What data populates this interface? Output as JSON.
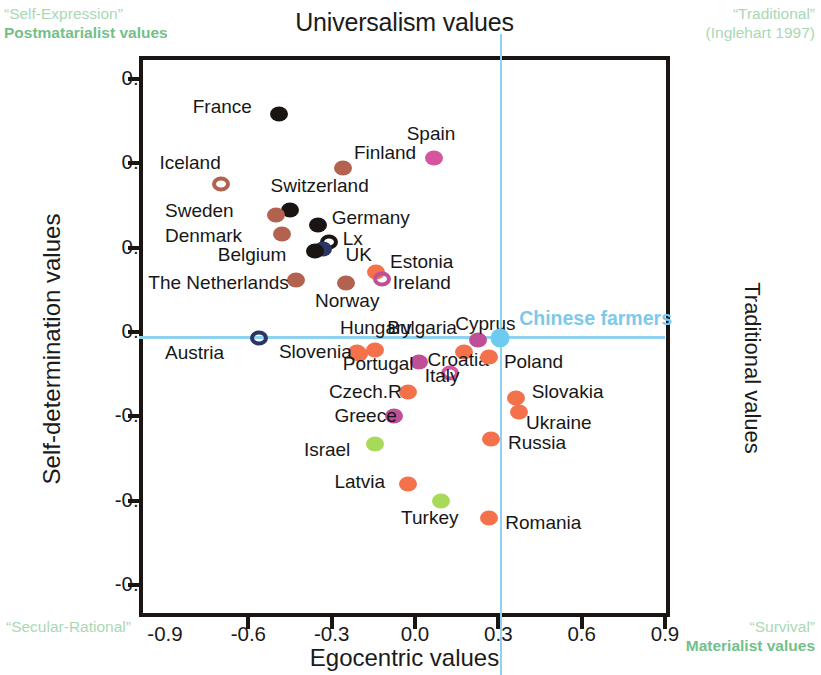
{
  "corners": {
    "top_left_quote": "“Self-Expression”",
    "top_left_bold": "Postmatarialist values",
    "top_right_quote": "“Traditional”",
    "top_right_source": "(Inglehart 1997)",
    "bottom_left_quote": "“Secular-Rational”",
    "bottom_right_quote": "“Survival”",
    "bottom_right_bold": "Materialist values"
  },
  "axes": {
    "title": "Universalism values",
    "xlabel": "Egocentric values",
    "ylabel": "Self-determination values",
    "right_label": "Traditional values",
    "xticks": [
      "-0.9",
      "-0.6",
      "-0.3",
      "0.0",
      "0.3",
      "0.6",
      "0.9"
    ],
    "yticks": [
      "0.9",
      "0.6",
      "0.3",
      "0.0",
      "-0.3",
      "-0.6",
      "-0.9"
    ]
  },
  "colors": {
    "orange": "#f4714b",
    "magenta": "#bf4f97",
    "pink": "#d6559f",
    "brown": "#b3624f",
    "black": "#1a1512",
    "navy": "#2b3566",
    "green": "#a8da5a",
    "lightblue": "#6ecbf0",
    "annotation_green": "#7cc58f",
    "reference_line": "#8ed2ef"
  },
  "chart_data": {
    "type": "scatter",
    "title": "Universalism values",
    "xlabel": "Egocentric values",
    "ylabel": "Self-determination values",
    "xlim": [
      -1.05,
      1.05
    ],
    "ylim": [
      -1.05,
      1.05
    ],
    "grid": false,
    "legend": "none",
    "reference_lines": {
      "x": 0.305,
      "y": -0.015,
      "label": "Chinese farmers"
    },
    "points": [
      {
        "name": "France",
        "x": -0.49,
        "y": 0.775,
        "color": "black",
        "filled": true,
        "lx": -0.8,
        "ly": 0.8
      },
      {
        "name": "Spain",
        "x": 0.07,
        "y": 0.62,
        "color": "pink",
        "filled": true,
        "lx": -0.03,
        "ly": 0.705
      },
      {
        "name": "Finland",
        "x": -0.26,
        "y": 0.585,
        "color": "brown",
        "filled": true,
        "lx": -0.22,
        "ly": 0.635
      },
      {
        "name": "Iceland",
        "x": -0.7,
        "y": 0.525,
        "color": "brown",
        "filled": false,
        "lx": -0.92,
        "ly": 0.6
      },
      {
        "name": "Switzerland",
        "x": -0.45,
        "y": 0.435,
        "color": "black",
        "filled": true,
        "lx": -0.52,
        "ly": 0.52
      },
      {
        "name": "Sweden",
        "x": -0.5,
        "y": 0.415,
        "color": "brown",
        "filled": true,
        "lx": -0.9,
        "ly": 0.43
      },
      {
        "name": "Germany",
        "x": -0.35,
        "y": 0.38,
        "color": "black",
        "filled": true,
        "lx": -0.3,
        "ly": 0.405
      },
      {
        "name": "Denmark",
        "x": -0.48,
        "y": 0.35,
        "color": "brown",
        "filled": true,
        "lx": -0.9,
        "ly": 0.34
      },
      {
        "name": "Lx",
        "x": -0.31,
        "y": 0.32,
        "color": "black",
        "filled": false,
        "lx": -0.26,
        "ly": 0.33
      },
      {
        "name": "UK",
        "x": -0.33,
        "y": 0.295,
        "color": "navy",
        "filled": true,
        "lx": -0.25,
        "ly": 0.275
      },
      {
        "name": "Belgium",
        "x": -0.36,
        "y": 0.288,
        "color": "black",
        "filled": true,
        "lx": -0.71,
        "ly": 0.275
      },
      {
        "name": "Estonia",
        "x": -0.14,
        "y": 0.215,
        "color": "orange",
        "filled": true,
        "lx": -0.09,
        "ly": 0.25
      },
      {
        "name": "Ireland",
        "x": -0.12,
        "y": 0.19,
        "color": "magenta",
        "filled": false,
        "lx": -0.08,
        "ly": 0.175
      },
      {
        "name": "The Netherlands",
        "x": -0.43,
        "y": 0.185,
        "color": "brown",
        "filled": true,
        "lx": -0.96,
        "ly": 0.175
      },
      {
        "name": "Norway",
        "x": -0.25,
        "y": 0.175,
        "color": "brown",
        "filled": true,
        "lx": -0.36,
        "ly": 0.11
      },
      {
        "name": "Austria",
        "x": -0.56,
        "y": -0.02,
        "color": "navy",
        "filled": false,
        "lx": -0.9,
        "ly": -0.075
      },
      {
        "name": "Cyprus",
        "x": 0.225,
        "y": -0.03,
        "color": "magenta",
        "filled": true,
        "lx": 0.145,
        "ly": 0.03
      },
      {
        "name": "Chinese farmers",
        "x": 0.305,
        "y": -0.02,
        "color": "lightblue",
        "filled": true,
        "lx": 0.375,
        "ly": 0.045
      },
      {
        "name": "Hungary",
        "x": -0.21,
        "y": -0.07,
        "color": "orange",
        "filled": true,
        "lx": -0.27,
        "ly": 0.015
      },
      {
        "name": "Bulgaria",
        "x": -0.145,
        "y": -0.065,
        "color": "orange",
        "filled": true,
        "lx": -0.1,
        "ly": 0.015
      },
      {
        "name": "Slovenia",
        "x": -0.2,
        "y": -0.08,
        "color": "orange",
        "filled": true,
        "lx": -0.49,
        "ly": -0.07
      },
      {
        "name": "Croatia",
        "x": 0.175,
        "y": -0.07,
        "color": "orange",
        "filled": true,
        "lx": 0.045,
        "ly": -0.1
      },
      {
        "name": "Poland",
        "x": 0.265,
        "y": -0.09,
        "color": "orange",
        "filled": true,
        "lx": 0.32,
        "ly": -0.105
      },
      {
        "name": "Portugal",
        "x": 0.015,
        "y": -0.105,
        "color": "magenta",
        "filled": true,
        "lx": -0.26,
        "ly": -0.115
      },
      {
        "name": "Italy",
        "x": 0.125,
        "y": -0.145,
        "color": "pink",
        "filled": false,
        "lx": 0.035,
        "ly": -0.155
      },
      {
        "name": "Czech.R",
        "x": -0.025,
        "y": -0.215,
        "color": "orange",
        "filled": true,
        "lx": -0.31,
        "ly": -0.215
      },
      {
        "name": "Slovakia",
        "x": 0.365,
        "y": -0.235,
        "color": "orange",
        "filled": true,
        "lx": 0.42,
        "ly": -0.215
      },
      {
        "name": "Ukraine",
        "x": 0.375,
        "y": -0.285,
        "color": "orange",
        "filled": true,
        "lx": 0.4,
        "ly": -0.325
      },
      {
        "name": "Greece",
        "x": -0.075,
        "y": -0.3,
        "color": "magenta",
        "filled": true,
        "lx": -0.29,
        "ly": -0.3
      },
      {
        "name": "Russia",
        "x": 0.275,
        "y": -0.38,
        "color": "orange",
        "filled": true,
        "lx": 0.335,
        "ly": -0.395
      },
      {
        "name": "Israel",
        "x": -0.145,
        "y": -0.4,
        "color": "green",
        "filled": true,
        "lx": -0.4,
        "ly": -0.42
      },
      {
        "name": "Latvia",
        "x": -0.025,
        "y": -0.54,
        "color": "orange",
        "filled": true,
        "lx": -0.29,
        "ly": -0.535
      },
      {
        "name": "Turkey",
        "x": 0.095,
        "y": -0.6,
        "color": "green",
        "filled": true,
        "lx": -0.05,
        "ly": -0.66
      },
      {
        "name": "Romania",
        "x": 0.265,
        "y": -0.66,
        "color": "orange",
        "filled": true,
        "lx": 0.325,
        "ly": -0.68
      }
    ]
  }
}
